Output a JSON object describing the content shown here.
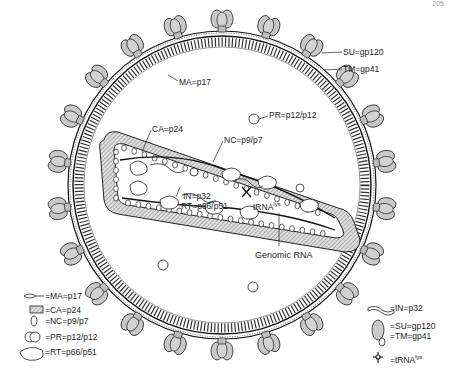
{
  "page": {
    "number": "205"
  },
  "diagram": {
    "colors": {
      "spike_fill": "#c8c8c8",
      "outline": "#1a1a1a",
      "capsid_hatch": "#9a9a9a",
      "background": "#ffffff"
    },
    "callouts": {
      "su": "SU=gp120",
      "tm": "TM=gp41",
      "ma": "MA=p17",
      "pr": "PR=p12/p12",
      "ca": "CA=p24",
      "nc": "NC=p9/p7",
      "in": "IN=p32",
      "rt": "RT=p66/p51",
      "trna": "tRNA",
      "trna_sup": "lys",
      "genomic_rna": "Genomic RNA"
    }
  },
  "legend": {
    "left": [
      {
        "icon": "ma-icon",
        "label": "=MA=p17"
      },
      {
        "icon": "ca-icon",
        "label": "=CA=p24"
      },
      {
        "icon": "nc-icon",
        "label": "=NC=p9/p7"
      },
      {
        "icon": "pr-icon",
        "label": "=PR=p12/p12"
      },
      {
        "icon": "rt-icon",
        "label": "=RT=p66/p51"
      }
    ],
    "right": [
      {
        "icon": "in-icon",
        "label": "=IN=p32"
      },
      {
        "icon": "su-tm-icon",
        "label": "=SU=gp120",
        "label2": "=TM=gp41"
      },
      {
        "icon": "trna-icon",
        "label": "=tRNA",
        "sup": "lys"
      }
    ]
  }
}
